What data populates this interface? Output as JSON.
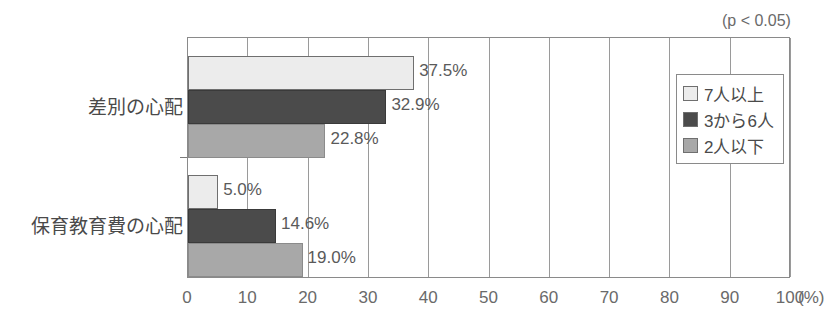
{
  "chart_data": {
    "type": "bar",
    "orientation": "horizontal",
    "title": "",
    "xlabel": "(%)",
    "ylabel": "",
    "xlim": [
      0,
      100
    ],
    "xticks": [
      "0",
      "10",
      "20",
      "30",
      "40",
      "50",
      "60",
      "70",
      "80",
      "90",
      "100"
    ],
    "x_unit_label": "(%)",
    "grid": true,
    "grid_axis": "x",
    "legend_position": "top-right-inside",
    "annotation": "(p < 0.05)",
    "categories": [
      "差別の心配",
      "保育教育費の心配"
    ],
    "series": [
      {
        "name": "7人以上",
        "color": "#ececec",
        "values": [
          37.5,
          5.0
        ],
        "labels": [
          "37.5%",
          "5.0%"
        ]
      },
      {
        "name": "3から6人",
        "color": "#4b4b4b",
        "values": [
          32.9,
          14.6
        ],
        "labels": [
          "32.9%",
          "14.6%"
        ]
      },
      {
        "name": "2人以下",
        "color": "#a8a8a8",
        "values": [
          22.8,
          19.0
        ],
        "labels": [
          "22.8%",
          "19.0%"
        ]
      }
    ]
  },
  "legend": {
    "items": [
      {
        "label": "7人以上",
        "swatch": "#ececec"
      },
      {
        "label": "3から6人",
        "swatch": "#4b4b4b"
      },
      {
        "label": "2人以下",
        "swatch": "#a8a8a8"
      }
    ]
  },
  "axis": {
    "x_tick_labels": [
      "0",
      "10",
      "20",
      "30",
      "40",
      "50",
      "60",
      "70",
      "80",
      "90",
      "100"
    ],
    "x_unit": "(%)"
  },
  "annotation": {
    "significance": "(p < 0.05)"
  },
  "colors": {
    "series_light": "#ececec",
    "series_dark": "#4b4b4b",
    "series_mid": "#a8a8a8",
    "axis": "#8a8a8a",
    "text": "#4a4a4a"
  }
}
